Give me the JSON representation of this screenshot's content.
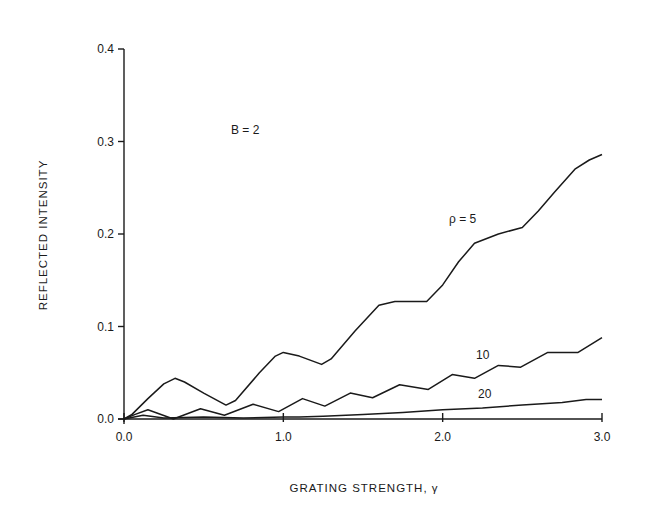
{
  "chart_data": {
    "type": "line",
    "title": "",
    "xlabel": "GRATING STRENGTH, γ",
    "ylabel": "REFLECTED INTENSITY",
    "xlim": [
      0.0,
      3.0
    ],
    "ylim": [
      0.0,
      0.4
    ],
    "x_ticks": [
      "0.0",
      "1.0",
      "2.0",
      "3.0"
    ],
    "y_ticks": [
      "0.0",
      "0.1",
      "0.2",
      "0.3",
      "0.4"
    ],
    "grid": false,
    "annotations": [
      {
        "text": "B = 2",
        "x": 0.7,
        "y": 0.31
      },
      {
        "text": "ρ = 5",
        "x": 2.1,
        "y": 0.215
      },
      {
        "text": "10",
        "x": 2.22,
        "y": 0.101
      },
      {
        "text": "20",
        "x": 2.23,
        "y": 0.043
      }
    ],
    "series": [
      {
        "name": "ρ = 5",
        "label": "ρ = 5",
        "x": [
          0.0,
          0.05,
          0.15,
          0.25,
          0.32,
          0.38,
          0.5,
          0.64,
          0.7,
          0.85,
          0.95,
          1.0,
          1.1,
          1.24,
          1.3,
          1.45,
          1.6,
          1.7,
          1.9,
          2.0,
          2.1,
          2.2,
          2.35,
          2.5,
          2.6,
          2.7,
          2.83,
          2.92,
          3.0
        ],
        "values": [
          0.0,
          0.005,
          0.022,
          0.038,
          0.044,
          0.04,
          0.028,
          0.015,
          0.02,
          0.05,
          0.068,
          0.072,
          0.068,
          0.059,
          0.065,
          0.095,
          0.123,
          0.127,
          0.127,
          0.145,
          0.17,
          0.19,
          0.2,
          0.207,
          0.225,
          0.245,
          0.27,
          0.28,
          0.286
        ]
      },
      {
        "name": "ρ = 10",
        "label": "10",
        "x": [
          0.0,
          0.07,
          0.15,
          0.31,
          0.48,
          0.63,
          0.81,
          0.97,
          1.12,
          1.26,
          1.42,
          1.56,
          1.73,
          1.91,
          2.06,
          2.2,
          2.35,
          2.49,
          2.66,
          2.85,
          3.0
        ],
        "values": [
          0.0,
          0.005,
          0.01,
          0.0,
          0.011,
          0.004,
          0.016,
          0.008,
          0.022,
          0.014,
          0.028,
          0.023,
          0.037,
          0.032,
          0.048,
          0.044,
          0.058,
          0.056,
          0.072,
          0.072,
          0.088
        ]
      },
      {
        "name": "ρ = 20",
        "label": "20",
        "x": [
          0.0,
          0.12,
          0.25,
          0.5,
          0.75,
          1.0,
          1.1,
          1.25,
          1.5,
          1.75,
          2.0,
          2.25,
          2.5,
          2.75,
          2.9,
          3.0
        ],
        "values": [
          0.0,
          0.004,
          0.001,
          0.002,
          0.001,
          0.002,
          0.002,
          0.003,
          0.005,
          0.007,
          0.01,
          0.012,
          0.015,
          0.018,
          0.021,
          0.021
        ]
      }
    ]
  },
  "plot": {
    "x_axis_title": "GRATING STRENGTH, γ",
    "y_axis_title": "REFLECTED INTENSITY",
    "annotation_b": "B = 2",
    "label_rho5": "ρ = 5",
    "label_rho10": "10",
    "label_rho20": "20"
  }
}
